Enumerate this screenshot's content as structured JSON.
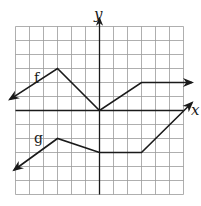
{
  "chart_data": {
    "type": "line",
    "title": "",
    "xlabel": "x",
    "ylabel": "y",
    "xlim": [
      -6,
      6
    ],
    "ylim": [
      -6,
      6
    ],
    "grid": true,
    "grid_step": 1,
    "tick_labels": false,
    "series": [
      {
        "name": "f",
        "points": [
          [
            -6.4,
            0.8
          ],
          [
            -3,
            3
          ],
          [
            0,
            0
          ],
          [
            3,
            2
          ],
          [
            6.6,
            2
          ]
        ],
        "arrows": "both"
      },
      {
        "name": "g",
        "points": [
          [
            -6.1,
            -4.25
          ],
          [
            -3,
            -2
          ],
          [
            0,
            -3
          ],
          [
            3,
            -3
          ],
          [
            6.6,
            0.55
          ]
        ],
        "arrows": "both"
      }
    ],
    "annotations": [
      {
        "text": "f",
        "x": -4.4,
        "y": 2.0
      },
      {
        "text": "g",
        "x": -4.4,
        "y": -2.2
      }
    ]
  },
  "labels": {
    "x_axis": "x",
    "y_axis": "y",
    "f": "f",
    "g": "g"
  },
  "colors": {
    "ink": "#1a1a1a",
    "grid": "#9a9a9a",
    "background": "#ffffff"
  }
}
